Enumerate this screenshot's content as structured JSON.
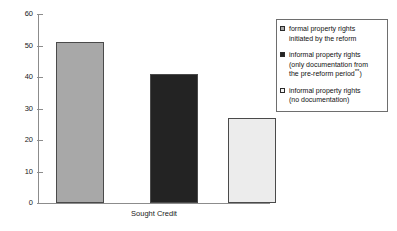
{
  "chart_data": {
    "type": "bar",
    "title": "",
    "subtitle": "",
    "xlabel": "Sought Credit",
    "ylabel": "",
    "ylim": [
      0,
      60
    ],
    "y_ticks": [
      "0",
      "10",
      "20",
      "30",
      "40",
      "50",
      "60"
    ],
    "grid": false,
    "legend_position": "right",
    "categories": [
      "Sought Credit"
    ],
    "series": [
      {
        "name": "formal property rights initiated by the reform",
        "values": [
          51
        ],
        "color": "#a8a8a8"
      },
      {
        "name": "informal property rights (only documentation from the pre-reform period**)",
        "values": [
          41
        ],
        "color": "#232323"
      },
      {
        "name": "informal property rights (no documentation)",
        "values": [
          27
        ],
        "color": "#ececec"
      }
    ]
  },
  "axis": {
    "x_label": "Sought Credit",
    "y_tick_labels": [
      "60",
      "50",
      "40",
      "30",
      "20",
      "10",
      "0"
    ]
  },
  "legend": {
    "entries": [
      {
        "swatch": "gray-square",
        "line1": "formal property rights",
        "line2": "initiated by the reform",
        "line3": "",
        "marker_color": "#a8a8a8"
      },
      {
        "swatch": "black-square",
        "line1": "informal property rights",
        "line2": "(only documentation from",
        "line3": "the pre-reform period",
        "superscript": "**",
        "line3_suffix": ")",
        "marker_color": "#232323"
      },
      {
        "swatch": "white-square",
        "line1": "informal property rights",
        "line2": "(no documentation)",
        "line3": "",
        "marker_color": "#f4f4f4"
      }
    ]
  },
  "colors": {
    "bar_formal": "#a8a8a8",
    "bar_informal_doc": "#232323",
    "bar_informal_nodoc": "#ececec",
    "axis": "#8c8c8c",
    "bar_outline": "#4a4a4a",
    "legend_border": "#6e6e6e",
    "text": "#111111"
  }
}
